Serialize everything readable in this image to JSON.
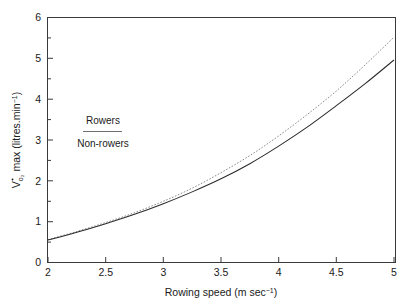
{
  "chart_data": {
    "type": "line",
    "title": "",
    "xlabel": "Rowing speed (m sec⁻¹)",
    "ylabel": "V̇o₂ max (litres.min⁻¹)",
    "xlim": [
      2,
      5
    ],
    "ylim": [
      0,
      6
    ],
    "grid": false,
    "legend_position": "upper-left-inside",
    "x_ticks": [
      2,
      2.5,
      3,
      3.5,
      4,
      4.5,
      5
    ],
    "x_tick_labels": [
      "2",
      "2.5",
      "3",
      "3.5",
      "4",
      "4.5",
      "5"
    ],
    "x_minor_ticks": [
      2.25,
      2.75,
      3.25,
      3.75,
      4.25,
      4.75
    ],
    "y_ticks": [
      0,
      1,
      2,
      3,
      4,
      5,
      6
    ],
    "y_tick_labels": [
      "0",
      "1",
      "2",
      "3",
      "4",
      "5",
      "6"
    ],
    "y_minor_ticks": [
      0.5,
      1.5,
      2.5,
      3.5,
      4.5,
      5.5
    ],
    "x": [
      2.0,
      2.25,
      2.5,
      2.75,
      3.0,
      3.25,
      3.5,
      3.75,
      4.0,
      4.25,
      4.5,
      4.75,
      5.0
    ],
    "series": [
      {
        "name": "Rowers",
        "style": "dotted",
        "color": "#8c8c8c",
        "values": [
          0.56,
          0.76,
          0.98,
          1.22,
          1.5,
          1.82,
          2.2,
          2.62,
          3.1,
          3.63,
          4.2,
          4.84,
          5.52
        ]
      },
      {
        "name": "Non-rowers",
        "style": "solid",
        "color": "#2b2b2b",
        "values": [
          0.55,
          0.74,
          0.95,
          1.18,
          1.44,
          1.73,
          2.05,
          2.42,
          2.85,
          3.32,
          3.84,
          4.38,
          4.96
        ]
      }
    ]
  },
  "axes": {
    "y_axis_label": "V̇o₂ max (litres.min⁻¹)",
    "y_axis_label_main": "V",
    "y_axis_label_sub": "o₂",
    "y_axis_label_rest": " max (litres.min",
    "y_axis_label_sup": "−1",
    "y_axis_label_tail": ")",
    "x_axis_label_main": "Rowing speed (m sec",
    "x_axis_label_sup": "−1",
    "x_axis_label_tail": ")"
  },
  "legend": {
    "rowers_label": "Rowers",
    "nonrowers_label": "Non-rowers"
  }
}
